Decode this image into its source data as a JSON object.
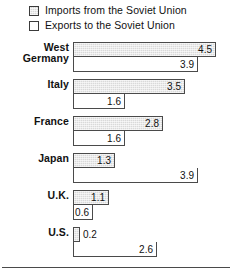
{
  "chart_data": {
    "type": "bar",
    "orientation": "horizontal",
    "grouped": true,
    "title": "",
    "xlabel": "",
    "ylabel": "",
    "xlim": [
      0,
      5
    ],
    "grid": false,
    "legend_position": "top-left",
    "categories": [
      "West Germany",
      "Italy",
      "France",
      "Japan",
      "U.K.",
      "U.S."
    ],
    "series": [
      {
        "name": "Imports from the Soviet Union",
        "style": "shaded",
        "values": [
          4.5,
          3.5,
          2.8,
          1.3,
          1.1,
          0.2
        ]
      },
      {
        "name": "Exports to the Soviet Union",
        "style": "open",
        "values": [
          3.9,
          1.6,
          1.6,
          3.9,
          0.6,
          2.6
        ]
      }
    ]
  },
  "legend": {
    "items": [
      {
        "label": "Imports from the Soviet Union",
        "swatch": "shaded-square-icon"
      },
      {
        "label": "Exports to the Soviet Union",
        "swatch": "open-square-icon"
      }
    ]
  },
  "groups": [
    {
      "label_line1": "West",
      "label_line2": "Germany",
      "imports": {
        "value": "4.5",
        "width_px": 143
      },
      "exports": {
        "value": "3.9",
        "width_px": 125
      }
    },
    {
      "label_line1": "Italy",
      "label_line2": "",
      "imports": {
        "value": "3.5",
        "width_px": 112
      },
      "exports": {
        "value": "1.6",
        "width_px": 52
      }
    },
    {
      "label_line1": "France",
      "label_line2": "",
      "imports": {
        "value": "2.8",
        "width_px": 90
      },
      "exports": {
        "value": "1.6",
        "width_px": 52
      }
    },
    {
      "label_line1": "Japan",
      "label_line2": "",
      "imports": {
        "value": "1.3",
        "width_px": 42
      },
      "exports": {
        "value": "3.9",
        "width_px": 125
      }
    },
    {
      "label_line1": "U.K.",
      "label_line2": "",
      "imports": {
        "value": "1.1",
        "width_px": 36
      },
      "exports": {
        "value": "0.6",
        "width_px": 20
      }
    },
    {
      "label_line1": "U.S.",
      "label_line2": "",
      "imports": {
        "value": "0.2",
        "width_px": 7
      },
      "exports": {
        "value": "2.6",
        "width_px": 84
      }
    }
  ],
  "colors": {
    "imports_fill": "#d9d9d9",
    "exports_fill": "#ffffff",
    "border": "#4a4a4a",
    "text": "#111111",
    "background": "#ffffff"
  }
}
